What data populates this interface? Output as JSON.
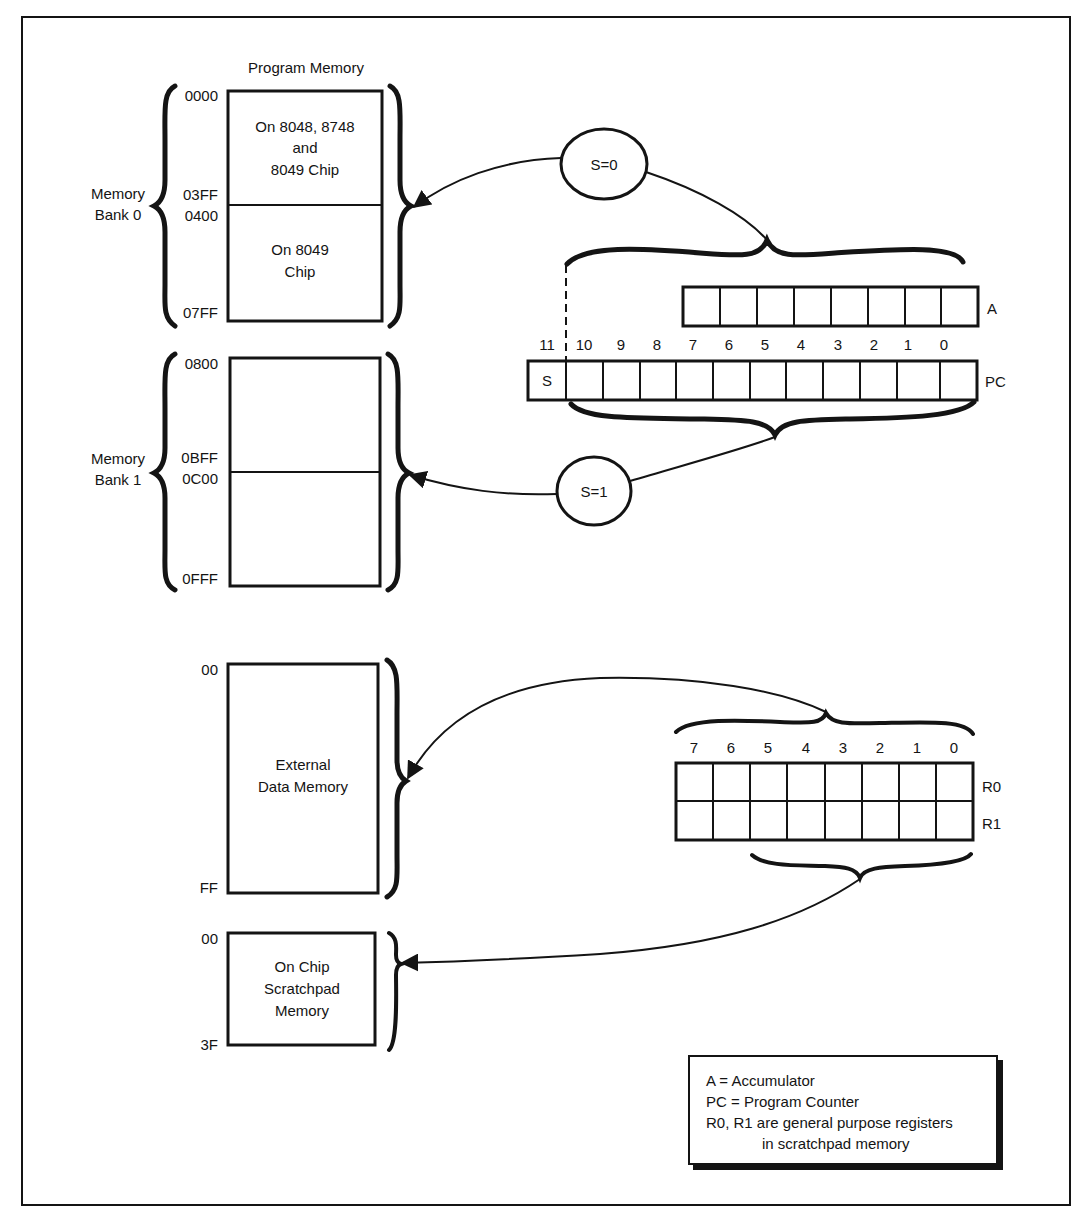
{
  "figure": {
    "program_memory": {
      "title": "Program Memory",
      "bank0": {
        "label_line1": "Memory",
        "label_line2": "Bank 0",
        "addresses": {
          "start": "0000",
          "split_end": "03FF",
          "split_start": "0400",
          "end": "07FF"
        },
        "upper_region": {
          "line1": "On 8048, 8748",
          "line2": "and",
          "line3": "8049 Chip"
        },
        "lower_region": {
          "line1": "On 8049",
          "line2": "Chip"
        }
      },
      "bank1": {
        "label_line1": "Memory",
        "label_line2": "Bank 1",
        "addresses": {
          "start": "0800",
          "split_end": "0BFF",
          "split_start": "0C00",
          "end": "0FFF"
        }
      }
    },
    "selectors": {
      "s0": "S=0",
      "s1": "S=1"
    },
    "registers": {
      "accumulator": {
        "label": "A",
        "bits": 8
      },
      "program_counter": {
        "label": "PC",
        "bit_numbers": [
          "11",
          "10",
          "9",
          "8",
          "7",
          "6",
          "5",
          "4",
          "3",
          "2",
          "1",
          "0"
        ],
        "msb_cell": "S"
      },
      "scratch": {
        "bit_numbers": [
          "7",
          "6",
          "5",
          "4",
          "3",
          "2",
          "1",
          "0"
        ],
        "row_labels": [
          "R0",
          "R1"
        ]
      }
    },
    "data_memory": {
      "external": {
        "line1": "External",
        "line2": "Data Memory",
        "start": "00",
        "end": "FF"
      },
      "scratchpad": {
        "line1": "On Chip",
        "line2": "Scratchpad",
        "line3": "Memory",
        "start": "00",
        "end": "3F"
      }
    },
    "legend": {
      "lines": [
        "A = Accumulator",
        "PC = Program Counter",
        "R0, R1 are general purpose registers",
        "in scratchpad memory"
      ]
    }
  }
}
